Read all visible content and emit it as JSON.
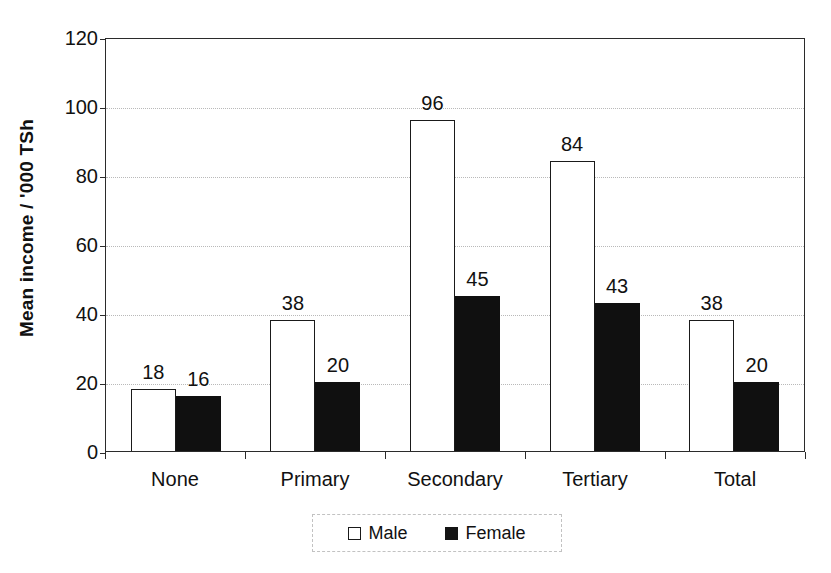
{
  "chart_data": {
    "type": "bar",
    "title": "",
    "subtitle": "",
    "xlabel": "",
    "ylabel": "Mean income / '000 TSh",
    "categories": [
      "None",
      "Primary",
      "Secondary",
      "Tertiary",
      "Total"
    ],
    "series": [
      {
        "name": "Male",
        "values": [
          18,
          38,
          96,
          84,
          38
        ],
        "fill": "#ffffff",
        "stroke": "#1a1a1a"
      },
      {
        "name": "Female",
        "values": [
          16,
          20,
          45,
          43,
          20
        ],
        "fill": "#101010",
        "stroke": "#101010"
      }
    ],
    "ylim": [
      0,
      120
    ],
    "yticks": [
      0,
      20,
      40,
      60,
      80,
      100,
      120
    ],
    "ytick_labels": [
      "0",
      "20",
      "40",
      "60",
      "80",
      "100",
      "120"
    ],
    "grid": "horizontal-dotted",
    "grid_color": "#b9b9b9",
    "axis_color": "#2b2b2b",
    "legend_position": "bottom-center",
    "data_labels": true,
    "bar_grouping": "adjacent-pairs"
  },
  "legend": {
    "entries": [
      {
        "label": "Male",
        "swatch": "open-square-swatch"
      },
      {
        "label": "Female",
        "swatch": "filled-square-swatch"
      }
    ]
  },
  "colors": {
    "background": "#ffffff",
    "text": "#111111",
    "male_bar": "#ffffff",
    "female_bar": "#101010",
    "gridline": "#b9b9b9",
    "axis": "#2b2b2b",
    "legend_border": "#c2c2c2"
  }
}
